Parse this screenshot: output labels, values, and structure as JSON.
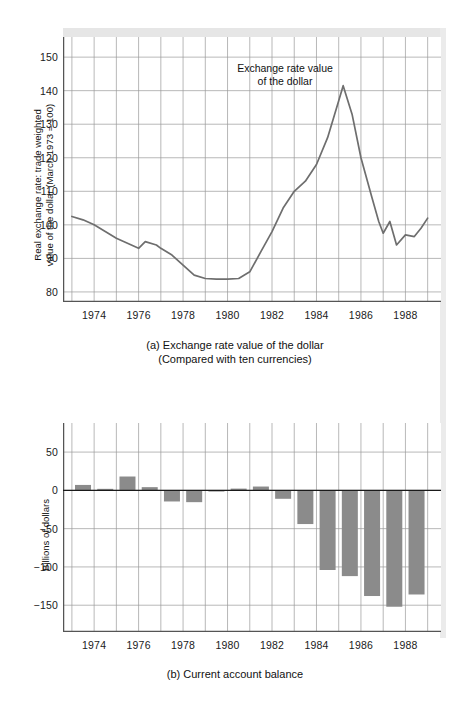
{
  "figure_a": {
    "caption_line1": "(a) Exchange rate value of the dollar",
    "caption_line2": "(Compared with ten currencies)",
    "annotation_line1": "Exchange rate value",
    "annotation_line2": "of the dollar",
    "yaxis_title_line1": "Real exchange rate: trade weighted",
    "yaxis_title_line2": "value of the dollar (March 1973 = 100)"
  },
  "figure_b": {
    "caption_line1": "(b) Current account balance",
    "yaxis_title": "Billions of dollars"
  },
  "colors": {
    "line": "#6e6e6e",
    "bar": "#8b8b8b",
    "grid": "#9a9a9a",
    "axis": "#555555",
    "text": "#111111",
    "band": "#e6e6e6"
  },
  "chart_data": [
    {
      "type": "line",
      "title": "Exchange rate value of the dollar",
      "subtitle": "(Compared with ten currencies)",
      "xlabel": "",
      "ylabel": "Real exchange rate: trade weighted value of the dollar (March 1973 = 100)",
      "xlim": [
        1972.6,
        1989.6
      ],
      "ylim": [
        77.0,
        156.0
      ],
      "yticks": [
        80,
        90,
        100,
        110,
        120,
        130,
        140,
        150
      ],
      "xticks": [
        1974,
        1976,
        1978,
        1980,
        1982,
        1984,
        1986,
        1988
      ],
      "xtick_minor_step": 1,
      "grid": true,
      "legend": "none",
      "annotations": [
        {
          "text": "Exchange rate value of the dollar",
          "x": 1983.0,
          "y": 148.0
        }
      ],
      "x": [
        1973.0,
        1973.5,
        1974.0,
        1974.5,
        1975.0,
        1975.5,
        1976.0,
        1976.3,
        1976.8,
        1977.0,
        1977.5,
        1978.0,
        1978.5,
        1979.0,
        1979.5,
        1980.0,
        1980.5,
        1981.0,
        1981.5,
        1982.0,
        1982.5,
        1983.0,
        1983.5,
        1984.0,
        1984.5,
        1985.0,
        1985.2,
        1985.6,
        1986.0,
        1986.5,
        1986.8,
        1987.0,
        1987.3,
        1987.6,
        1988.0,
        1988.4,
        1988.7,
        1989.0
      ],
      "y": [
        102.5,
        101.5,
        100.0,
        98.0,
        96.0,
        94.5,
        93.0,
        95.0,
        94.0,
        93.0,
        91.0,
        88.0,
        85.0,
        84.0,
        83.8,
        83.8,
        84.0,
        86.0,
        92.0,
        98.0,
        105.0,
        110.0,
        113.0,
        118.0,
        126.0,
        137.0,
        141.5,
        133.0,
        120.0,
        108.0,
        101.0,
        97.5,
        101.0,
        94.0,
        97.0,
        96.5,
        99.0,
        102.0,
        97.5
      ]
    },
    {
      "type": "bar",
      "title": "Current account balance",
      "xlabel": "",
      "ylabel": "Billions of dollars",
      "ylim": [
        -185,
        88
      ],
      "yticks": [
        50,
        0,
        -50,
        -100,
        -150
      ],
      "xticks": [
        1974,
        1976,
        1978,
        1980,
        1982,
        1984,
        1986,
        1988
      ],
      "grid": true,
      "legend": "none",
      "categories": [
        1973,
        1974,
        1975,
        1976,
        1977,
        1978,
        1979,
        1980,
        1981,
        1982,
        1983,
        1984,
        1985,
        1986,
        1987,
        1988
      ],
      "values": [
        7.1,
        2.0,
        18.1,
        4.2,
        -14.5,
        -15.4,
        -1.0,
        2.3,
        5.0,
        -11.0,
        -44.0,
        -104.0,
        -112.0,
        -138.0,
        -152.0,
        -136.0
      ]
    }
  ]
}
